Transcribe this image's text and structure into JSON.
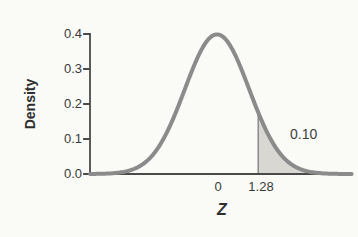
{
  "figure": {
    "background": "#fafaf6"
  },
  "chart_data": {
    "type": "area",
    "title": "",
    "distribution": "standard-normal-density",
    "mean": 0,
    "sd": 1,
    "xlabel": "Z",
    "ylabel": "Density",
    "ylim": [
      0,
      0.4
    ],
    "xlim_z": [
      -3.94,
      4.19
    ],
    "y_tick_values": [
      0.4,
      0.3,
      0.2,
      0.1,
      0.0
    ],
    "y_tick_labels": [
      "0.4",
      "0.3",
      "0.2",
      "0.1",
      "0.0"
    ],
    "x_ticks": [
      {
        "z": 0,
        "label": "0"
      },
      {
        "z": 1.28,
        "label": "1.28"
      }
    ],
    "peak_density": 0.4,
    "shaded_region": {
      "tail": "right",
      "from_z": 1.28,
      "to_z": 4.19,
      "area": 0.1,
      "label": "0.10"
    },
    "grid": false,
    "legend": false,
    "colors": {
      "curve": "#8b8b8b",
      "fill": "#d8d7d2",
      "axis": "#4a4a4a",
      "boundary_line": "#8a8a8a",
      "text": "#3b3b3b"
    }
  }
}
